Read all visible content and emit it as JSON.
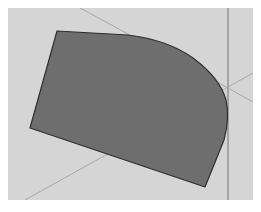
{
  "canvas": {
    "width": 261,
    "height": 212,
    "viewport": {
      "x": 8,
      "y": 8,
      "width": 245,
      "height": 192
    },
    "colors": {
      "page_background": "#ffffff",
      "viewport_background": "#d5d5d5",
      "axis_line": "#a9a9a9",
      "vertical_axis_line": "#a3a3a3",
      "face_fill": "#6e6e6e",
      "face_edge": "#2e2e2e"
    }
  },
  "guides": {
    "vertical_axis": {
      "x": 220,
      "y1": 0,
      "y2": 192
    },
    "diagonal_axes": [
      {
        "name": "red-axis-upper",
        "x1": 72,
        "y1": 0,
        "x2": 220,
        "y2": 80
      },
      {
        "name": "green-axis-lower",
        "x1": 17,
        "y1": 192,
        "x2": 245,
        "y2": 65
      },
      {
        "name": "red-axis-right",
        "x1": 220,
        "y1": 80,
        "x2": 245,
        "y2": 94
      }
    ]
  },
  "shape": {
    "name": "extruded-face",
    "path": "M 49 23 L 120 27 Q 160 32 185 50 Q 212 70 218 92 Q 222 110 216 132 L 197 179 L 22 120 Z"
  }
}
